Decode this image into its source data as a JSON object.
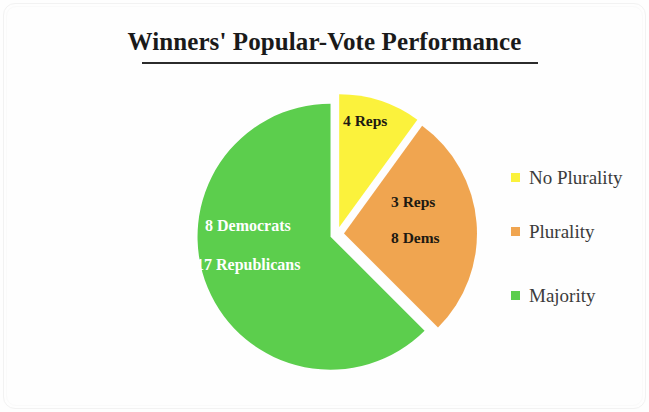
{
  "chart_data": {
    "type": "pie",
    "title": "Winners' Popular-Vote Performance",
    "xlabel": "",
    "ylabel": "",
    "grid": false,
    "legend_position": "right",
    "total": 40,
    "start_angle_deg": 0,
    "direction": "clockwise",
    "exploded": true,
    "categories": [
      "No Plurality",
      "Plurality",
      "Majority"
    ],
    "values": [
      4,
      11,
      25
    ],
    "colors": [
      "#FBF23C",
      "#F0A550",
      "#5CCE4D"
    ],
    "slices": [
      {
        "name": "No Plurality",
        "value": 4,
        "color": "#FBF23C",
        "start_deg": 0,
        "end_deg": 36,
        "label_color": "#1d1a12",
        "data_labels": [
          "4 Reps"
        ],
        "breakdown": [
          {
            "party": "Reps",
            "count": 4
          }
        ]
      },
      {
        "name": "Plurality",
        "value": 11,
        "color": "#F0A550",
        "start_deg": 36,
        "end_deg": 135,
        "label_color": "#1d1a12",
        "data_labels": [
          "3 Reps",
          "8 Dems"
        ],
        "breakdown": [
          {
            "party": "Reps",
            "count": 3
          },
          {
            "party": "Dems",
            "count": 8
          }
        ]
      },
      {
        "name": "Majority",
        "value": 25,
        "color": "#5CCE4D",
        "start_deg": 135,
        "end_deg": 360,
        "label_color": "#ffffff",
        "data_labels": [
          "8 Democrats",
          "17 Republicans"
        ],
        "breakdown": [
          {
            "party": "Democrats",
            "count": 8
          },
          {
            "party": "Republicans",
            "count": 17
          }
        ]
      }
    ]
  },
  "title": {
    "text": "Winners' Popular-Vote Performance"
  },
  "pie": {
    "labels": {
      "yellow_1": "4 Reps",
      "orange_1": "3 Reps",
      "orange_2": "8 Dems",
      "green_1": "8 Democrats",
      "green_2": "17 Republicans"
    },
    "geometry": {
      "center_x": 147,
      "center_y": 144,
      "radius": 133
    },
    "slice_colors": {
      "no_plurality": "#FBF23C",
      "plurality": "#F0A550",
      "majority": "#5CCE4D"
    }
  },
  "legend": {
    "items": [
      {
        "label": "No Plurality",
        "color": "#FBF23C"
      },
      {
        "label": "Plurality",
        "color": "#F0A550"
      },
      {
        "label": "Majority",
        "color": "#5CCE4D"
      }
    ]
  }
}
